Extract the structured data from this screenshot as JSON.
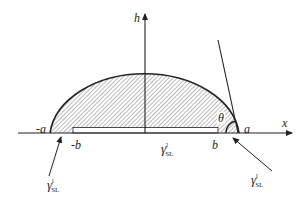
{
  "diagram": {
    "type": "sessile-droplet-contact-angle",
    "axes": {
      "x_label": "x",
      "y_label": "h"
    },
    "points": {
      "neg_a": "-a",
      "neg_b": "-b",
      "b": "b",
      "a": "a"
    },
    "angle_label": "θ",
    "surface_tensions": {
      "left": {
        "symbol": "γ",
        "sub": "SL",
        "sup": "1"
      },
      "center": {
        "symbol": "γ",
        "sub": "SL",
        "sup": "2"
      },
      "right": {
        "symbol": "γ",
        "sub": "SL",
        "sup": "1"
      }
    },
    "colors": {
      "line": "#222222",
      "hatch": "#555555",
      "background": "#ffffff"
    }
  }
}
